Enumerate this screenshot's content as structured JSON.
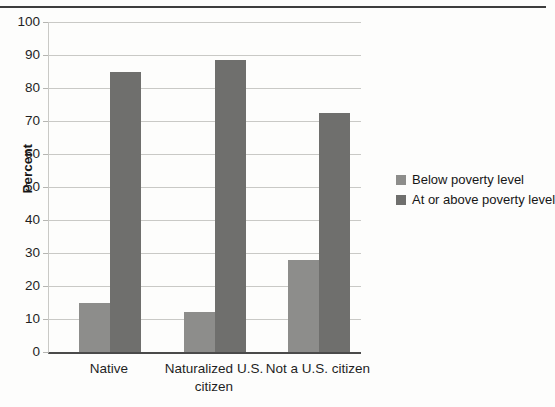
{
  "page": {
    "background_color": "#fdfdfc",
    "top_rule_color": "#3d3d3d"
  },
  "chart_data": {
    "type": "bar",
    "title": "",
    "xlabel": "",
    "ylabel": "Percent",
    "ylim": [
      0,
      100
    ],
    "yticks": [
      0,
      10,
      20,
      30,
      40,
      50,
      60,
      70,
      80,
      90,
      100
    ],
    "grid": "horizontal",
    "gridline_color": "#c9c9c6",
    "axis_line_color": "#4a4a4a",
    "legend_position": "right",
    "categories": [
      "Native",
      "Naturalized U.S. citizen",
      "Not a U.S. citizen"
    ],
    "series": [
      {
        "name": "Below poverty level",
        "color": "#8d8d8b",
        "values": [
          15,
          12,
          28
        ]
      },
      {
        "name": "At or above poverty level",
        "color": "#6f6f6d",
        "values": [
          85,
          88.5,
          72.5
        ]
      }
    ]
  },
  "layout": {
    "group_lefts": [
      30,
      135,
      239
    ],
    "label_centers": [
      61,
      166,
      270
    ]
  }
}
